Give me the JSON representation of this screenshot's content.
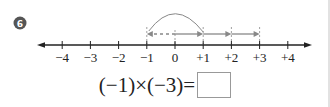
{
  "problem": {
    "number_badge": "6",
    "badge_color": "#555555"
  },
  "number_line": {
    "range": [
      -4,
      4
    ],
    "ticks": [
      -4,
      -3,
      -2,
      -1,
      0,
      1,
      2,
      3,
      4
    ],
    "tick_labels": [
      "−4",
      "−3",
      "−2",
      "−1",
      "0",
      "+1",
      "+2",
      "+3",
      "+4"
    ],
    "repeated_steps": {
      "from": 0,
      "step": 1,
      "count": 3,
      "style": "solid"
    },
    "dashed_step": {
      "from": 0,
      "to": -1,
      "style": "dashed"
    },
    "arc": {
      "from": 1,
      "to": -1
    },
    "guide_lines_at": [
      -1,
      1,
      2,
      3
    ],
    "axis_color": "#222222",
    "arrow_color": "#888888"
  },
  "equation": {
    "left": "(−1)×(−3)=",
    "answer": ""
  }
}
